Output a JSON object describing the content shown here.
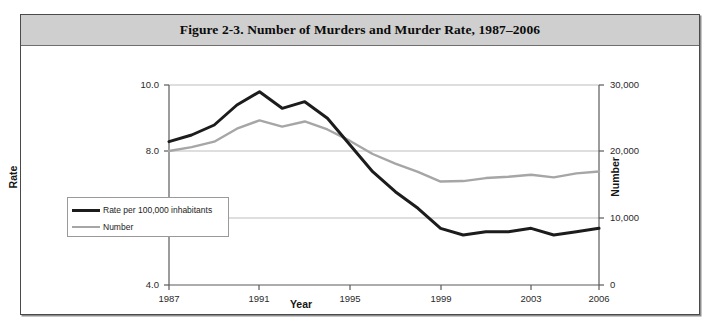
{
  "figure": {
    "title": "Figure 2-3. Number of Murders and Murder Rate, 1987–2006"
  },
  "legend": {
    "items": [
      {
        "label": "Rate per 100,000 inhabitants",
        "color": "#1c1c1c"
      },
      {
        "label": "Number",
        "color": "#a6a6a6"
      }
    ]
  },
  "axes": {
    "xlabel": "Year",
    "ylabel_left": "Rate",
    "ylabel_right": "Number",
    "yticks_left": [
      "4.0",
      "6.0",
      "8.0",
      "10.0"
    ],
    "yticks_right": [
      "0",
      "10,000",
      "20,000",
      "30,000"
    ],
    "xticks": [
      "1987",
      "1991",
      "1995",
      "1999",
      "2003",
      "2006"
    ]
  },
  "chart_data": {
    "type": "line",
    "title": "Figure 2-3. Number of Murders and Murder Rate, 1987–2006",
    "xlabel": "Year",
    "ylabel": "Rate",
    "ylabel_secondary": "Number",
    "grid": true,
    "legend_position": "lower-left-inside",
    "x": [
      1987,
      1988,
      1989,
      1990,
      1991,
      1992,
      1993,
      1994,
      1995,
      1996,
      1997,
      1998,
      1999,
      2000,
      2001,
      2002,
      2003,
      2004,
      2005,
      2006
    ],
    "xlim": [
      1987,
      2006
    ],
    "xticks": [
      1987,
      1991,
      1995,
      1999,
      2003,
      2006
    ],
    "yticks_left": [
      4.0,
      6.0,
      8.0,
      10.0
    ],
    "ylim_left": [
      4.0,
      10.0
    ],
    "yticks_right": [
      0,
      10000,
      20000,
      30000
    ],
    "ylim_right": [
      0,
      30000
    ],
    "series": [
      {
        "name": "Rate per 100,000 inhabitants",
        "axis": "left",
        "color": "#1c1c1c",
        "values": [
          8.3,
          8.5,
          8.8,
          9.4,
          9.8,
          9.3,
          9.5,
          9.0,
          8.2,
          7.4,
          6.8,
          6.3,
          5.7,
          5.5,
          5.6,
          5.6,
          5.7,
          5.5,
          5.6,
          5.7
        ]
      },
      {
        "name": "Number",
        "axis": "right",
        "color": "#a6a6a6",
        "values": [
          20100,
          20680,
          21500,
          23440,
          24700,
          23760,
          24530,
          23330,
          21610,
          19650,
          18210,
          16970,
          15520,
          15590,
          16040,
          16230,
          16530,
          16150,
          16740,
          17030
        ]
      }
    ]
  }
}
